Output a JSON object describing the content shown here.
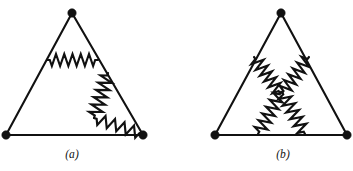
{
  "figure": {
    "kind": "circuit-diagram",
    "background_color": "#ffffff",
    "ink_color": "#111111",
    "canvas": {
      "width": 353,
      "height": 171
    },
    "panels": [
      {
        "id": "panel-a",
        "label": "(a)",
        "label_position": {
          "x": 72,
          "y": 157
        },
        "outline": {
          "kind": "triangle",
          "stroke_width": 2.1,
          "vertices": [
            {
              "name": "apex",
              "x": 72,
              "y": 13
            },
            {
              "name": "bottom-left",
              "x": 6,
              "y": 135
            },
            {
              "name": "bottom-right",
              "x": 143,
              "y": 135
            }
          ]
        },
        "nodes": [
          {
            "name": "node-apex",
            "x": 72,
            "y": 13,
            "radius": 4.2
          },
          {
            "name": "node-bottom-left",
            "x": 6,
            "y": 135,
            "radius": 4.2
          },
          {
            "name": "node-bottom-right",
            "x": 143,
            "y": 135,
            "radius": 4.2
          }
        ],
        "resistors": [
          {
            "name": "resistor-horizontal-upper",
            "from": {
              "x": 47,
              "y": 60
            },
            "to": {
              "x": 98,
              "y": 60
            },
            "zigzag_peaks": 11,
            "amplitude": 6.0
          },
          {
            "name": "resistor-diagonal-descending",
            "from": {
              "x": 108,
              "y": 73
            },
            "to": {
              "x": 94,
              "y": 118
            },
            "zigzag_peaks": 11,
            "amplitude": 6.5
          },
          {
            "name": "resistor-diagonal-to-bottom-right",
            "from": {
              "x": 94,
              "y": 118
            },
            "to": {
              "x": 142,
              "y": 134
            },
            "zigzag_peaks": 9,
            "amplitude": 5.6
          }
        ]
      },
      {
        "id": "panel-b",
        "label": "(b)",
        "label_position": {
          "x": 283,
          "y": 157
        },
        "outline": {
          "kind": "triangle",
          "stroke_width": 2.1,
          "vertices": [
            {
              "name": "apex",
              "x": 281,
              "y": 13
            },
            {
              "name": "bottom-left",
              "x": 215,
              "y": 135
            },
            {
              "name": "bottom-right",
              "x": 347,
              "y": 135
            }
          ]
        },
        "nodes": [
          {
            "name": "node-apex",
            "x": 281,
            "y": 13,
            "radius": 4.2
          },
          {
            "name": "node-bottom-left",
            "x": 215,
            "y": 135,
            "radius": 4.2
          },
          {
            "name": "node-bottom-right",
            "x": 347,
            "y": 135,
            "radius": 4.2
          }
        ],
        "resistors": [
          {
            "name": "resistor-upper-left-arm",
            "from": {
              "x": 254,
              "y": 57
            },
            "to": {
              "x": 280,
              "y": 93
            },
            "zigzag_peaks": 11,
            "amplitude": 6.2
          },
          {
            "name": "resistor-upper-right-arm",
            "from": {
              "x": 309,
              "y": 57
            },
            "to": {
              "x": 282,
              "y": 93
            },
            "zigzag_peaks": 11,
            "amplitude": 6.2
          },
          {
            "name": "resistor-lower-left-arm",
            "from": {
              "x": 281,
              "y": 92
            },
            "to": {
              "x": 258,
              "y": 134
            },
            "zigzag_peaks": 11,
            "amplitude": 6.2
          },
          {
            "name": "resistor-lower-right-arm",
            "from": {
              "x": 282,
              "y": 92
            },
            "to": {
              "x": 305,
              "y": 134
            },
            "zigzag_peaks": 11,
            "amplitude": 6.2
          }
        ]
      }
    ]
  }
}
